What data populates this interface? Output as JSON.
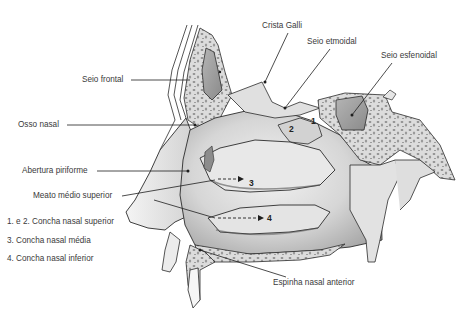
{
  "diagram": {
    "labels": {
      "crista_galli": "Crista Galli",
      "seio_etmoidal": "Seio etmoidal",
      "seio_esfenoidal": "Seio esfenoidal",
      "seio_frontal": "Seio frontal",
      "osso_nasal": "Osso nasal",
      "abertura_piriforme": "Abertura piriforme",
      "meato_medio_superior": "Meato médio superior",
      "espinha_nasal_anterior": "Espinha nasal anterior"
    },
    "legend": [
      "1. e 2. Concha nasal superior",
      "3. Concha nasal média",
      "4. Concha nasal inferior"
    ],
    "markers": {
      "m1": "1",
      "m2": "2",
      "m3": "3",
      "m4": "4"
    },
    "colors": {
      "outline": "#2b2b2b",
      "tissue_light": "#e6e6e6",
      "tissue_mid": "#c9c9c9",
      "tissue_dark": "#9a9a9a",
      "bone_spongy": "#d8d8d8",
      "label_text": "#3a3a3a",
      "leader_line": "#1e1e1e"
    }
  }
}
